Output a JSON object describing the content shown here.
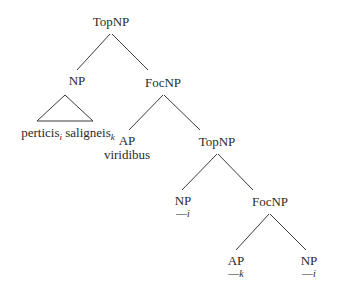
{
  "diagram": {
    "type": "syntax-tree",
    "line_color": "#3a3a3a",
    "nodes": {
      "root": {
        "label": "TopNP"
      },
      "np1": {
        "label": "NP",
        "content_main1": "perticis",
        "sub1": "i",
        "content_main2": " saligneis",
        "sub2": "k"
      },
      "focnp1": {
        "label": "FocNP"
      },
      "ap1": {
        "label": "AP",
        "word": "viridibus"
      },
      "topnp2": {
        "label": "TopNP"
      },
      "np2": {
        "label": "NP",
        "trace": "—",
        "index": "i"
      },
      "focnp2": {
        "label": "FocNP"
      },
      "ap2": {
        "label": "AP",
        "trace": "—",
        "index": "k"
      },
      "np3": {
        "label": "NP",
        "trace": "—",
        "index": "i"
      }
    },
    "edges": [
      [
        "root",
        "np1"
      ],
      [
        "root",
        "focnp1"
      ],
      [
        "focnp1",
        "ap1"
      ],
      [
        "focnp1",
        "topnp2"
      ],
      [
        "topnp2",
        "np2"
      ],
      [
        "topnp2",
        "focnp2"
      ],
      [
        "focnp2",
        "ap2"
      ],
      [
        "focnp2",
        "np3"
      ]
    ]
  }
}
